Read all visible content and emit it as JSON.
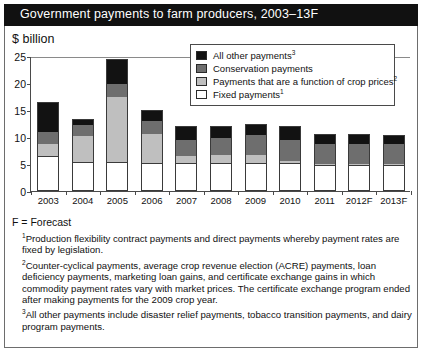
{
  "header": {
    "title": "Government payments to farm producers, 2003–13F"
  },
  "axis": {
    "unit_label": "$ billion",
    "y_ticks": [
      "0",
      "5",
      "10",
      "15",
      "20",
      "25"
    ],
    "x_labels": [
      "2003",
      "2004",
      "2005",
      "2006",
      "2007",
      "2008",
      "2009",
      "2010",
      "2011",
      "2012F",
      "2013F"
    ]
  },
  "legend": {
    "items": [
      {
        "label": "All other payments",
        "sup": "3",
        "key": "other",
        "color": "#121212"
      },
      {
        "label": "Conservation payments",
        "sup": "",
        "key": "cons",
        "color": "#6e6e6e"
      },
      {
        "label": " Payments that are a function of crop prices",
        "sup": "2",
        "key": "crop",
        "color": "#bfbfbf"
      },
      {
        "label": "Fixed payments",
        "sup": "1",
        "key": "fixed",
        "color": "#ffffff"
      }
    ]
  },
  "notes": {
    "forecast": "F = Forecast",
    "footnotes": [
      {
        "marker": "1",
        "text": "Production flexibility contract payments and direct payments whereby payment rates are fixed by legislation."
      },
      {
        "marker": "2",
        "text": "Counter-cyclical payments, average crop revenue election (ACRE) payments, loan deficiency payments, marketing loan gains, and certificate exchange gains in which commodity payment rates vary with market prices. The certificate exchange program ended after making payments for the 2009 crop year."
      },
      {
        "marker": "3",
        "text": "All other payments include disaster relief payments, tobacco transition payments, and dairy program payments."
      }
    ]
  },
  "chart_data": {
    "type": "bar",
    "stacked": true,
    "title": "Government payments to farm producers, 2003–13F",
    "xlabel": "",
    "ylabel": "$ billion",
    "ylim": [
      0,
      25
    ],
    "ytick_step": 5,
    "grid": false,
    "legend_position": "top-right",
    "categories": [
      "2003",
      "2004",
      "2005",
      "2006",
      "2007",
      "2008",
      "2009",
      "2010",
      "2011",
      "2012F",
      "2013F"
    ],
    "series": [
      {
        "name": "Fixed payments",
        "color": "#ffffff",
        "values": [
          6.4,
          5.3,
          5.4,
          5.1,
          5.2,
          5.2,
          5.2,
          5.2,
          4.9,
          4.9,
          4.9
        ]
      },
      {
        "name": "Payments that are a function of crop prices",
        "color": "#bfbfbf",
        "values": [
          2.4,
          4.9,
          12.0,
          5.4,
          1.3,
          1.4,
          1.5,
          0.4,
          0.1,
          0.1,
          0.1
        ]
      },
      {
        "name": "Conservation payments",
        "color": "#6e6e6e",
        "values": [
          2.2,
          2.1,
          2.5,
          2.4,
          3.0,
          3.2,
          3.6,
          3.9,
          3.6,
          3.6,
          3.6
        ]
      },
      {
        "name": "All other payments",
        "color": "#121212",
        "values": [
          5.4,
          1.1,
          4.6,
          2.1,
          2.5,
          2.3,
          2.2,
          2.5,
          1.8,
          1.8,
          1.7
        ]
      }
    ],
    "totals": [
      16.4,
      13.4,
      24.5,
      15.0,
      12.0,
      12.1,
      12.5,
      12.0,
      10.4,
      10.4,
      10.3
    ]
  }
}
